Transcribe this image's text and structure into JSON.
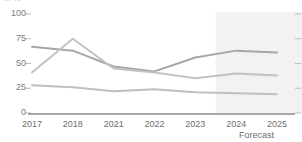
{
  "clipped_header": "in %",
  "axis": {
    "y_ticks": [
      "100",
      "75",
      "50",
      "25",
      "0"
    ],
    "y_values": [
      100,
      75,
      50,
      25,
      0
    ],
    "x_ticks": [
      "2017",
      "2018",
      "2021",
      "2022",
      "2023",
      "2024",
      "2025"
    ]
  },
  "forecast": {
    "label": "Forecast",
    "band_color": "#f2f2f2",
    "start_category": "2024",
    "end_category": "2025"
  },
  "colors": {
    "series_dark": "#a6a6a6",
    "series_mid": "#c2c2c2",
    "series_light": "#bfbfbf",
    "axis_line": "#8c8c8c",
    "tick_mark": "#bdbdbd",
    "tick_text": "#6e6e6e"
  },
  "chart_data": {
    "type": "line",
    "title": "",
    "subtitle": "",
    "xlabel": "",
    "ylabel": "in %",
    "ylim": [
      0,
      100
    ],
    "grid": false,
    "legend_position": "none",
    "categories": [
      "2017",
      "2018",
      "2021",
      "2022",
      "2023",
      "2024",
      "2025"
    ],
    "series": [
      {
        "name": "Series 1",
        "color": "#a6a6a6",
        "values": [
          67,
          63,
          47,
          42,
          56,
          63,
          61
        ]
      },
      {
        "name": "Series 2",
        "color": "#c2c2c2",
        "values": [
          41,
          75,
          45,
          41,
          35,
          40,
          38
        ]
      },
      {
        "name": "Series 3",
        "color": "#bfbfbf",
        "values": [
          28,
          26,
          22,
          24,
          21,
          20,
          19
        ]
      }
    ],
    "annotations": [
      {
        "text": "Forecast",
        "covers": [
          "2024",
          "2025"
        ]
      }
    ]
  }
}
